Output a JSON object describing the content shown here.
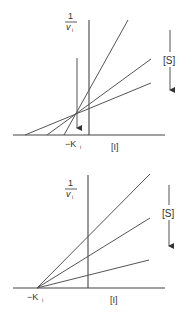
{
  "panels": [
    {
      "id": "top",
      "type": "uncompetitive-dixon-plot",
      "y_axis_label_num": "1",
      "y_axis_label_den": "v",
      "y_axis_label_sub": "i",
      "x_axis_label": "[I]",
      "intercept_label": "−K",
      "intercept_label_sub": "i",
      "arrow_label": "[S]",
      "arrow_direction": "down",
      "lines": [
        {
          "name": "steep",
          "x1": 64,
          "y1": 135,
          "x2": 128,
          "y2": 20
        },
        {
          "name": "middle",
          "x1": 47,
          "y1": 135,
          "x2": 151,
          "y2": 59
        },
        {
          "name": "shallow",
          "x1": 25,
          "y1": 135,
          "x2": 151,
          "y2": 83
        }
      ]
    },
    {
      "id": "bottom",
      "type": "noncompetitive-dixon-plot",
      "y_axis_label_num": "1",
      "y_axis_label_den": "v",
      "y_axis_label_sub": "i",
      "x_axis_label": "[I]",
      "intercept_label": "−K",
      "intercept_label_sub": "i",
      "arrow_label": "[S]",
      "arrow_direction": "down",
      "lines": [
        {
          "name": "steep",
          "x1": 37,
          "y1": 288,
          "x2": 150,
          "y2": 174
        },
        {
          "name": "middle",
          "x1": 37,
          "y1": 288,
          "x2": 150,
          "y2": 218
        },
        {
          "name": "shallow",
          "x1": 37,
          "y1": 288,
          "x2": 149,
          "y2": 260
        }
      ]
    }
  ],
  "colors": {
    "line": "#555555",
    "text": "#333333",
    "background": "#ffffff"
  }
}
